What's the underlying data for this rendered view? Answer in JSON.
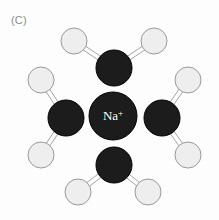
{
  "figure": {
    "panel_label": "(C)",
    "caption_text": "(C)",
    "background_color": "#fdfdfd",
    "width": 219,
    "height": 220
  },
  "colors": {
    "oxygen_fill": "#1c1c1c",
    "oxygen_stroke": "#000000",
    "hydrogen_fill": "#eeeeee",
    "hydrogen_stroke": "#9a9a9a",
    "ion_fill": "#1c1c1c",
    "ion_stroke": "#000000",
    "ion_text": "#ffffff",
    "bond_stroke": "#9a9a9a",
    "label_text": "#8b8b8b"
  },
  "diagram": {
    "type": "molecular-solvation-shell",
    "central_ion": {
      "name": "sodium-ion",
      "label": "Na",
      "charge": "+",
      "label_full": "Na+",
      "cx": 113,
      "cy": 116,
      "r": 24,
      "atom_type": "ion"
    },
    "water_molecules": [
      {
        "name": "water-molecule-top",
        "oxygen": {
          "cx": 114,
          "cy": 68,
          "r": 18,
          "atom_type": "oxygen",
          "element": "O"
        },
        "hydrogens": [
          {
            "name": "hydrogen-top-left",
            "cx": 74,
            "cy": 41,
            "r": 13,
            "atom_type": "hydrogen",
            "element": "H"
          },
          {
            "name": "hydrogen-top-right",
            "cx": 154,
            "cy": 41,
            "r": 13,
            "atom_type": "hydrogen",
            "element": "H"
          }
        ]
      },
      {
        "name": "water-molecule-left",
        "oxygen": {
          "cx": 66,
          "cy": 118,
          "r": 18,
          "atom_type": "oxygen",
          "element": "O"
        },
        "hydrogens": [
          {
            "name": "hydrogen-left-upper",
            "cx": 41,
            "cy": 80,
            "r": 13,
            "atom_type": "hydrogen",
            "element": "H"
          },
          {
            "name": "hydrogen-left-lower",
            "cx": 41,
            "cy": 155,
            "r": 13,
            "atom_type": "hydrogen",
            "element": "H"
          }
        ]
      },
      {
        "name": "water-molecule-right",
        "oxygen": {
          "cx": 162,
          "cy": 118,
          "r": 18,
          "atom_type": "oxygen",
          "element": "O"
        },
        "hydrogens": [
          {
            "name": "hydrogen-right-upper",
            "cx": 188,
            "cy": 80,
            "r": 13,
            "atom_type": "hydrogen",
            "element": "H"
          },
          {
            "name": "hydrogen-right-lower",
            "cx": 188,
            "cy": 155,
            "r": 13,
            "atom_type": "hydrogen",
            "element": "H"
          }
        ]
      },
      {
        "name": "water-molecule-bottom",
        "oxygen": {
          "cx": 114,
          "cy": 165,
          "r": 18,
          "atom_type": "oxygen",
          "element": "O"
        },
        "hydrogens": [
          {
            "name": "hydrogen-bottom-left",
            "cx": 78,
            "cy": 192,
            "r": 13,
            "atom_type": "hydrogen",
            "element": "H"
          },
          {
            "name": "hydrogen-bottom-right",
            "cx": 148,
            "cy": 192,
            "r": 13,
            "atom_type": "hydrogen",
            "element": "H"
          }
        ]
      }
    ],
    "bond_style": {
      "render": "double-parallel-line",
      "offset": 2.2,
      "width": 0.9
    }
  }
}
